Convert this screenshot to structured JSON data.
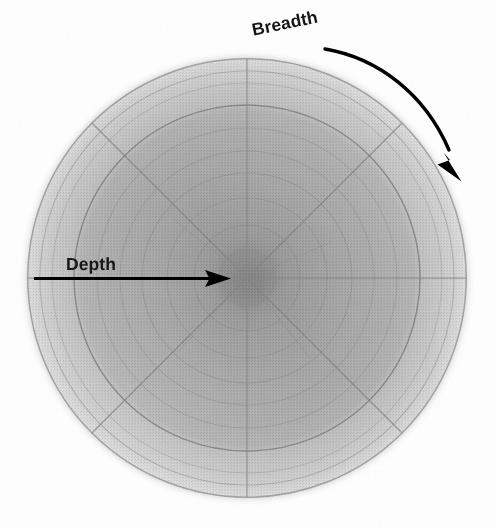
{
  "figure": {
    "kind": "polar-radial-diagram",
    "background_color": "#ffffff",
    "canvas": {
      "width": 496,
      "height": 527
    },
    "labels": {
      "depth": "Depth",
      "breadth": "Breadth"
    },
    "label_color": "#161616",
    "annotations": [
      {
        "name": "depth-arrow",
        "type": "straight-arrow",
        "label": "Depth",
        "direction": "inward-horizontal-right",
        "from": [
          34,
          278
        ],
        "to": [
          230,
          278
        ],
        "color": "#000000"
      },
      {
        "name": "breadth-arrow",
        "type": "curved-arrow",
        "label": "Breadth",
        "direction": "clockwise-along-arc",
        "from": [
          325,
          49
        ],
        "to": [
          461,
          180
        ],
        "color": "#000000"
      }
    ]
  },
  "chart_data": {
    "type": "pie",
    "title": "",
    "subtitle": "",
    "xlabel": "Depth",
    "ylabel": "Breadth",
    "grid": true,
    "legend_position": "none",
    "polar": {
      "center": [
        247,
        278
      ],
      "outer_radius": 220,
      "radial_axis_label": "Depth",
      "angular_axis_label": "Breadth",
      "spoke_count": 8,
      "spoke_angles_deg": [
        0,
        45,
        90,
        135,
        180,
        225,
        270,
        315
      ],
      "ring_radii": [
        28,
        53,
        80,
        105,
        127,
        150,
        173,
        195,
        207,
        220
      ],
      "ring_line_color": "#8e8e8e",
      "zones": [
        {
          "name": "core",
          "inner_radius": 0,
          "outer_radius": 28,
          "fill": "#9a9a9a"
        },
        {
          "name": "inner",
          "inner_radius": 28,
          "outer_radius": 105,
          "fill": "#a4a4a4"
        },
        {
          "name": "mid",
          "inner_radius": 105,
          "outer_radius": 173,
          "fill": "#aeaeae"
        },
        {
          "name": "outer",
          "inner_radius": 173,
          "outer_radius": 207,
          "fill": "#c4c4c4"
        },
        {
          "name": "rim",
          "inner_radius": 207,
          "outer_radius": 220,
          "fill": "#d7d7d7"
        }
      ]
    },
    "categories": [
      "Depth",
      "Breadth"
    ],
    "values": [
      220,
      360
    ],
    "annotations": [
      "Depth",
      "Breadth"
    ]
  }
}
